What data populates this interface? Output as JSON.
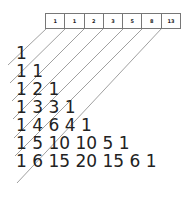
{
  "fibonacci_sums": [
    "1",
    "1",
    "2",
    "3",
    "5",
    "8",
    "13"
  ],
  "rows": [
    "1",
    "1 1",
    "1 2 1",
    "1 3 3 1",
    "1 4 6 4 1",
    "1 5 10 10 5 1",
    "1 6 15 20 15 6 1"
  ],
  "colors": {
    "text": "#222222",
    "line": "#888888",
    "box_border": "#777777"
  }
}
